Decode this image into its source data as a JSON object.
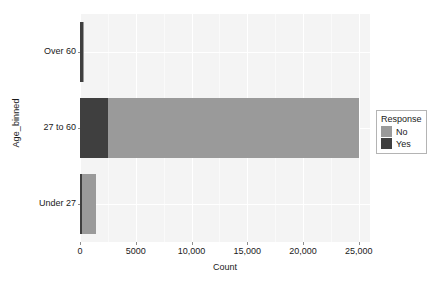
{
  "chart_data": {
    "type": "bar",
    "orientation": "horizontal",
    "stacked": true,
    "title": "",
    "xlabel": "Count",
    "ylabel": "Age_binned",
    "categories": [
      "Under 27",
      "27 to 60",
      "Over 60"
    ],
    "category_order_top_to_bottom": [
      "Over 60",
      "27 to 60",
      "Under 27"
    ],
    "series": [
      {
        "name": "Yes",
        "color": "#3f3f3f",
        "values": [
          150,
          2500,
          300
        ]
      },
      {
        "name": "No",
        "color": "#9a9a9a",
        "values": [
          1250,
          22500,
          100
        ]
      }
    ],
    "xlim": [
      0,
      26000
    ],
    "xticks": [
      0,
      5000,
      10000,
      15000,
      20000,
      25000
    ],
    "xtick_labels": [
      "0",
      "5000",
      "10,000",
      "15,000",
      "20,000",
      "25,000"
    ],
    "grid": true,
    "grid_color": "#ffffff",
    "panel_background": "#f4f4f4",
    "legend": {
      "title": "Response",
      "position": "right",
      "entries": [
        {
          "label": "No",
          "color": "#9a9a9a"
        },
        {
          "label": "Yes",
          "color": "#3f3f3f"
        }
      ]
    }
  }
}
